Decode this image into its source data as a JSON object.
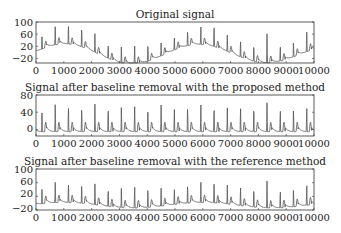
{
  "chart_data": [
    {
      "type": "line",
      "title": "Original signal",
      "xlabel": "",
      "ylabel": "",
      "xlim": [
        0,
        10000
      ],
      "ylim": [
        -35,
        100
      ],
      "xticks": [
        0,
        1000,
        2000,
        3000,
        4000,
        5000,
        6000,
        7000,
        8000,
        9000,
        10000
      ],
      "yticks": [
        -20,
        20,
        60,
        100
      ],
      "ytick_labels": [
        "−20",
        "20",
        "60",
        "100"
      ],
      "grid": false,
      "series": [
        {
          "name": "original",
          "color": "#555555",
          "beat_count": 21,
          "r_peak_approx": [
            60,
            65,
            70,
            72,
            62,
            55,
            60,
            65,
            70,
            45,
            50,
            55,
            60,
            88,
            60,
            58,
            62,
            97,
            60,
            55,
            70
          ],
          "baseline_wander": "slow drift between about -30 and 25"
        }
      ]
    },
    {
      "type": "line",
      "title": "Signal after baseline removal with the proposed method",
      "xlabel": "",
      "ylabel": "",
      "xlim": [
        0,
        10000
      ],
      "ylim": [
        -15,
        80
      ],
      "xticks": [
        0,
        1000,
        2000,
        3000,
        4000,
        5000,
        6000,
        7000,
        8000,
        9000,
        10000
      ],
      "yticks": [
        0,
        40,
        80
      ],
      "ytick_labels": [
        "0",
        "40",
        "80"
      ],
      "grid": false,
      "series": [
        {
          "name": "proposed",
          "color": "#555555",
          "beat_count": 21,
          "r_peak_approx": [
            65,
            68,
            65,
            65,
            65,
            65,
            65,
            65,
            65,
            65,
            65,
            65,
            65,
            70,
            62,
            62,
            65,
            68,
            62,
            58,
            58
          ],
          "baseline": "flat near -5"
        }
      ]
    },
    {
      "type": "line",
      "title": "Signal after baseline removal with the reference method",
      "xlabel": "",
      "ylabel": "",
      "xlim": [
        0,
        10000
      ],
      "ylim": [
        -20,
        100
      ],
      "xticks": [
        0,
        1000,
        2000,
        3000,
        4000,
        5000,
        6000,
        7000,
        8000,
        9000,
        10000
      ],
      "yticks": [
        -20,
        20,
        60,
        100
      ],
      "ytick_labels": [
        "−20",
        "20",
        "60",
        "100"
      ],
      "grid": false,
      "series": [
        {
          "name": "reference",
          "color": "#555555",
          "beat_count": 21,
          "r_peak_approx": [
            62,
            65,
            62,
            65,
            62,
            60,
            65,
            68,
            70,
            55,
            55,
            60,
            62,
            78,
            62,
            60,
            62,
            80,
            60,
            58,
            62
          ],
          "baseline": "partially flattened, residual drift near -10 to 15"
        }
      ]
    }
  ],
  "panels": [
    {
      "title": "Original signal"
    },
    {
      "title": "Signal after baseline removal with the proposed method"
    },
    {
      "title": "Signal after baseline removal with the reference method"
    }
  ],
  "x_tick_labels": [
    "0",
    "1000",
    "2000",
    "3000",
    "4000",
    "5000",
    "6000",
    "7000",
    "8000",
    "9000",
    "10000"
  ],
  "colors": {
    "line": "#555555",
    "axes": "#333333",
    "text": "#222222"
  }
}
